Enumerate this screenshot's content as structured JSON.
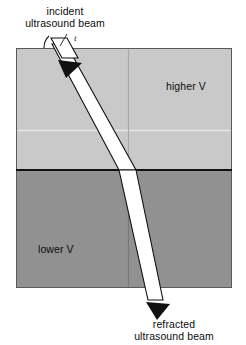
{
  "figure": {
    "width": 246,
    "height": 345
  },
  "captions": {
    "incident_line1": "incident",
    "incident_line2": "ultrasound beam",
    "refracted_line1": "refracted",
    "refracted_line2": "ultrasound beam"
  },
  "regions": {
    "upper_label": "higher V",
    "lower_label": "lower V"
  },
  "annotations": {
    "angle_symbol": "t"
  },
  "colors": {
    "background": "#ffffff",
    "upper_medium": "#c9c9c9",
    "lower_medium": "#919191",
    "interface_line": "#111111",
    "beam_fill": "#ffffff",
    "beam_outline": "#111111",
    "arrow_fill": "#111111",
    "grid_line_light": "#e8e8e8",
    "grid_line_dark": "#8a8a8a",
    "box_border": "#4a4a4a",
    "text": "#0d0d0d"
  },
  "geometry": {
    "box": {
      "x": 16,
      "y": 48,
      "width": 216,
      "height": 240
    },
    "interface_y": 170,
    "vertical_line_x": 128,
    "horizontal_light_line_y": 130,
    "incident_entry_x": 58,
    "refraction_point_x": 128,
    "refracted_exit_x": 155
  }
}
